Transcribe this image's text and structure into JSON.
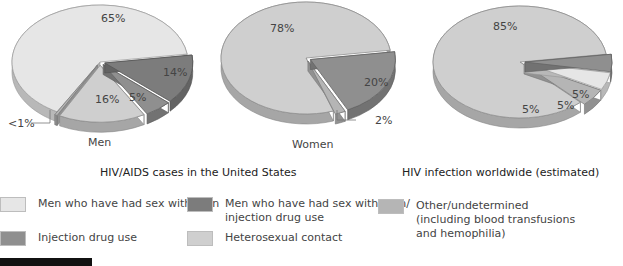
{
  "chart_data": [
    {
      "type": "pie",
      "title": "Men",
      "group": "HIV/AIDS cases in the United States",
      "slices": [
        {
          "category": "Men who have had sex with men",
          "value": 65,
          "label": "65%"
        },
        {
          "category": "Men who have had sex with men/ injection drug use",
          "value": 14,
          "label": "14%"
        },
        {
          "category": "Injection drug use",
          "value": 5,
          "label": "5%"
        },
        {
          "category": "Heterosexual contact",
          "value": 16,
          "label": "16%"
        },
        {
          "category": "Other/undetermined",
          "value": 0.5,
          "label": "<1%"
        }
      ]
    },
    {
      "type": "pie",
      "title": "Women",
      "group": "HIV/AIDS cases in the United States",
      "slices": [
        {
          "category": "Heterosexual contact",
          "value": 78,
          "label": "78%"
        },
        {
          "category": "Injection drug use",
          "value": 20,
          "label": "20%"
        },
        {
          "category": "Other/undetermined",
          "value": 2,
          "label": "2%"
        }
      ]
    },
    {
      "type": "pie",
      "title": "",
      "group": "HIV infection worldwide (estimated)",
      "slices": [
        {
          "category": "Heterosexual contact",
          "value": 85,
          "label": "85%"
        },
        {
          "category": "Injection drug use",
          "value": 5,
          "label": "5%"
        },
        {
          "category": "Men who have had sex with men",
          "value": 5,
          "label": "5%"
        },
        {
          "category": "Other/undetermined",
          "value": 5,
          "label": "5%"
        }
      ]
    }
  ],
  "titles": {
    "men": "Men",
    "women": "Women",
    "us_group": "HIV/AIDS cases in the United States",
    "world_group": "HIV infection worldwide (estimated)"
  },
  "legend": [
    {
      "label": "Men who have had sex with men",
      "color": "#e6e6e6"
    },
    {
      "label": "Men who have had sex with men/\ninjection drug use",
      "color": "#7c7c7c"
    },
    {
      "label": "Other/undetermined\n(including blood transfusions\nand hemophilia)",
      "color": "#b5b5b5"
    },
    {
      "label": "Injection drug use",
      "color": "#8f8f8f"
    },
    {
      "label": "Heterosexual contact",
      "color": "#cfcfcf"
    }
  ],
  "colors": {
    "Men who have had sex with men": "#e6e6e6",
    "Men who have had sex with men/ injection drug use": "#7c7c7c",
    "Injection drug use": "#8f8f8f",
    "Heterosexual contact": "#cfcfcf",
    "Other/undetermined": "#b5b5b5"
  }
}
